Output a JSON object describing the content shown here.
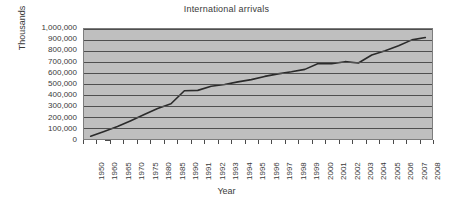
{
  "chart_data": {
    "type": "line",
    "title": "International arrivals",
    "xlabel": "Year",
    "ylabel": "Thousands",
    "ylim": [
      0,
      1000000
    ],
    "ytick_step": 100000,
    "grid": true,
    "legend": "none",
    "plot_background": "#bfbfbf",
    "line_color": "#2b2b2b",
    "categories": [
      "1950",
      "1960",
      "1965",
      "1970",
      "1975",
      "1980",
      "1985",
      "1990",
      "1991",
      "1992",
      "1993",
      "1994",
      "1995",
      "1996",
      "1997",
      "1998",
      "1999",
      "2000",
      "2001",
      "2002",
      "2003",
      "2004",
      "2005",
      "2006",
      "2007",
      "2008"
    ],
    "values": [
      25000,
      69000,
      113000,
      166000,
      222000,
      278000,
      320000,
      439000,
      442000,
      479000,
      495000,
      519000,
      540000,
      569000,
      592000,
      611000,
      633000,
      687000,
      684000,
      703000,
      691000,
      764000,
      803000,
      847000,
      901000,
      922000
    ],
    "ytick_labels": [
      "1,000,000",
      "900,000",
      "800,000",
      "700,000",
      "600,000",
      "500,000",
      "400,000",
      "300,000",
      "200,000",
      "100,000",
      "0"
    ],
    "ytick_values": [
      1000000,
      900000,
      800000,
      700000,
      600000,
      500000,
      400000,
      300000,
      200000,
      100000,
      0
    ]
  }
}
